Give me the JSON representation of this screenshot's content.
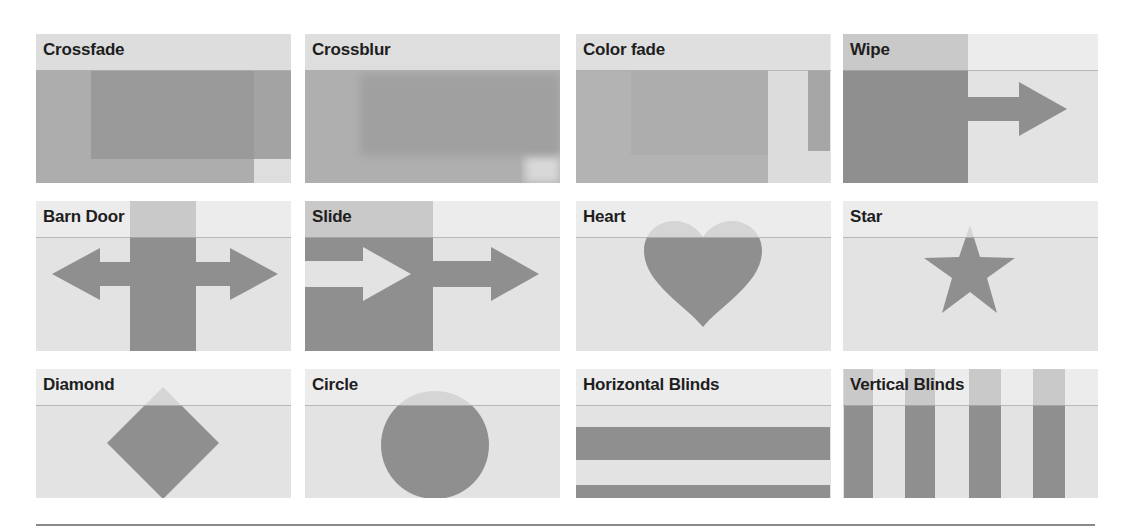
{
  "colors": {
    "page_background": "#ffffff",
    "tile_background": "#e3e3e3",
    "header_band": "#efefef",
    "shape_dark": "#8f8f8f",
    "shape_mid": "#a9a9a9",
    "label_text": "#1e1e1e",
    "divider": "#8a8a8a"
  },
  "transitions": [
    {
      "label": "Crossfade",
      "icon": "crossfade-icon"
    },
    {
      "label": "Crossblur",
      "icon": "crossblur-icon"
    },
    {
      "label": "Color fade",
      "icon": "color-fade-icon"
    },
    {
      "label": "Wipe",
      "icon": "wipe-arrow-icon"
    },
    {
      "label": "Barn Door",
      "icon": "barn-door-double-arrow-icon"
    },
    {
      "label": "Slide",
      "icon": "slide-arrow-icon"
    },
    {
      "label": "Heart",
      "icon": "heart-icon"
    },
    {
      "label": "Star",
      "icon": "star-icon"
    },
    {
      "label": "Diamond",
      "icon": "diamond-icon"
    },
    {
      "label": "Circle",
      "icon": "circle-icon"
    },
    {
      "label": "Horizontal Blinds",
      "icon": "horizontal-blinds-icon"
    },
    {
      "label": "Vertical Blinds",
      "icon": "vertical-blinds-icon"
    }
  ]
}
